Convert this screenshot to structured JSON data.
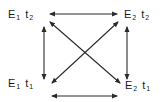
{
  "diagram": {
    "type": "state-transition-square",
    "nodes": [
      {
        "id": "E1t2",
        "position": "top-left",
        "symbol": "E",
        "sub1": "1",
        "symbol2": "t",
        "sub2": "2"
      },
      {
        "id": "E2t2",
        "position": "top-right",
        "symbol": "E",
        "sub1": "2",
        "symbol2": "t",
        "sub2": "2"
      },
      {
        "id": "E1t1",
        "position": "bottom-left",
        "symbol": "E",
        "sub1": "1",
        "symbol2": "t",
        "sub2": "1"
      },
      {
        "id": "E2t1",
        "position": "bottom-right",
        "symbol": "E",
        "sub1": "2",
        "symbol2": "t",
        "sub2": "1"
      }
    ],
    "edges": [
      {
        "from": "E1t2",
        "to": "E2t2",
        "direction": "bidirectional"
      },
      {
        "from": "E1t1",
        "to": "E2t1",
        "direction": "bidirectional"
      },
      {
        "from": "E1t2",
        "to": "E1t1",
        "direction": "bidirectional"
      },
      {
        "from": "E2t2",
        "to": "E2t1",
        "direction": "bidirectional"
      },
      {
        "from": "E1t2",
        "to": "E2t1",
        "direction": "bidirectional"
      },
      {
        "from": "E1t1",
        "to": "E2t2",
        "direction": "bidirectional"
      }
    ],
    "colors": {
      "line": "#2a2a2a",
      "text": "#1a1a1a",
      "background": "#ffffff"
    }
  }
}
